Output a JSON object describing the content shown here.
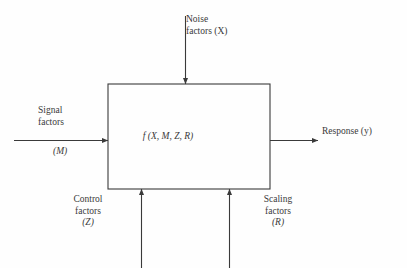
{
  "diagram": {
    "type": "block-diagram",
    "block": {
      "name": "system-block",
      "function_label": "f (X, M, Z, R)",
      "x": 108,
      "y": 84,
      "width": 162,
      "height": 105
    },
    "inputs": [
      {
        "id": "noise",
        "label_line1": "Noise",
        "label_line2": "factors (X)",
        "symbol": "X",
        "direction": "down",
        "edge": "top"
      },
      {
        "id": "signal",
        "label_line1": "Signal",
        "label_line2": "factors",
        "symbol": "(M)",
        "direction": "right",
        "edge": "left"
      },
      {
        "id": "control",
        "label_line1": "Control",
        "label_line2": "factors",
        "symbol": "(Z)",
        "direction": "up",
        "edge": "bottom"
      },
      {
        "id": "scaling",
        "label_line1": "Scaling",
        "label_line2": "factors",
        "symbol": "(R)",
        "direction": "up",
        "edge": "bottom"
      }
    ],
    "outputs": [
      {
        "id": "response",
        "label": "Response (y)",
        "symbol": "y",
        "direction": "right",
        "edge": "right"
      }
    ],
    "colors": {
      "background": "#fefefe",
      "stroke": "#3a3a3a",
      "text": "#3a3a3a"
    }
  }
}
